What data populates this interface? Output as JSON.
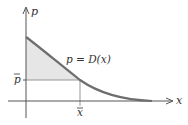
{
  "diagram": {
    "type": "consumer-surplus",
    "axes": {
      "x_label": "x",
      "y_label": "p"
    },
    "curve_label": "p = D(x)",
    "ticks": {
      "x_bar": "x",
      "p_bar": "p"
    },
    "colors": {
      "curve": "#6e6e6e",
      "axes": "#555555",
      "fill": "#e6e6e6",
      "guide": "#8a8a8a"
    }
  }
}
